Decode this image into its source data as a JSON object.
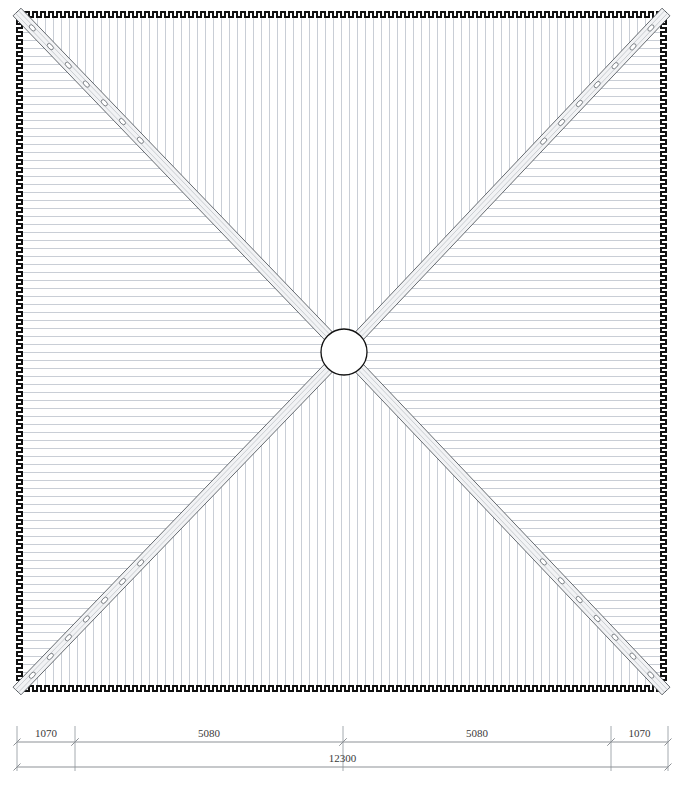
{
  "drawing": {
    "type": "roof-plan",
    "title_caption": "",
    "view_name": "Roof Plan",
    "units": "mm",
    "line_color": "#1a1a1a",
    "rib_color": "#c9ced6",
    "rafter_fill": "#f2f3f5",
    "rafter_edge": "#555a60",
    "dimension_color": "#8d9196",
    "text_color": "#3a3a3a",
    "background": "#ffffff"
  },
  "roof": {
    "shape": "hip",
    "plan_left": 17,
    "plan_top": 12,
    "plan_right": 666,
    "plan_bottom": 691,
    "edge_profile": "castellated",
    "castellation_period": 8,
    "castellation_depth": 5,
    "rib_spacing": 8,
    "panels": [
      {
        "name": "north-panel",
        "rib_direction": "vertical"
      },
      {
        "name": "east-panel",
        "rib_direction": "horizontal"
      },
      {
        "name": "south-panel",
        "rib_direction": "vertical"
      },
      {
        "name": "west-panel",
        "rib_direction": "horizontal"
      }
    ]
  },
  "hub": {
    "name": "center-hub-ring",
    "cx": 344,
    "cy": 352,
    "radius": 23
  },
  "rafters": [
    {
      "name": "hip-rafter-nw",
      "from": "top-left-corner",
      "to": "center-hub"
    },
    {
      "name": "hip-rafter-ne",
      "from": "top-right-corner",
      "to": "center-hub"
    },
    {
      "name": "hip-rafter-se",
      "from": "bottom-right-corner",
      "to": "center-hub"
    },
    {
      "name": "hip-rafter-sw",
      "from": "bottom-left-corner",
      "to": "center-hub"
    }
  ],
  "rafter_detail": {
    "band_width": 11,
    "bolt_count_per_rafter": 7,
    "bolt_radius": 2.6,
    "bolt_start_offset": 22,
    "bolt_spacing": 26
  },
  "dimensions": {
    "name": "bottom-dimension-stack",
    "rows": [
      {
        "name": "segment-dimension-row",
        "y": 742,
        "segments": [
          {
            "label": "1070",
            "x_start": 17,
            "x_end": 75
          },
          {
            "label": "5080",
            "x_start": 75,
            "x_end": 343
          },
          {
            "label": "5080",
            "x_start": 343,
            "x_end": 611
          },
          {
            "label": "1070",
            "x_start": 611,
            "x_end": 668
          }
        ]
      },
      {
        "name": "overall-dimension-row",
        "y": 767,
        "segments": [
          {
            "label": "12300",
            "x_start": 17,
            "x_end": 668
          }
        ]
      }
    ],
    "extension_line_top": 726,
    "tick_positions": [
      17,
      75,
      343,
      611,
      668
    ]
  }
}
